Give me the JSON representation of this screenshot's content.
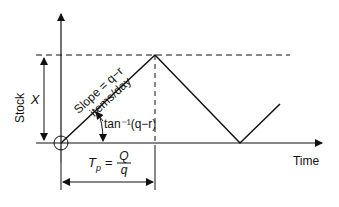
{
  "diagram": {
    "axes": {
      "y_label": "Stock",
      "x_label": "Time"
    },
    "labels": {
      "max_stock": "X",
      "slope_line1": "Slope = q−r",
      "slope_line2": "items/day",
      "angle": "tan⁻¹(q−r)",
      "tp_lhs": "T",
      "tp_sub": "p",
      "tp_eq": "=",
      "tp_num": "Q",
      "tp_den": "q"
    },
    "colors": {
      "line": "#111111",
      "background": "#ffffff"
    },
    "geometry": {
      "origin": [
        61,
        143
      ],
      "peak": [
        155,
        55
      ],
      "valley": [
        240,
        143
      ],
      "end": [
        280,
        104
      ]
    }
  }
}
